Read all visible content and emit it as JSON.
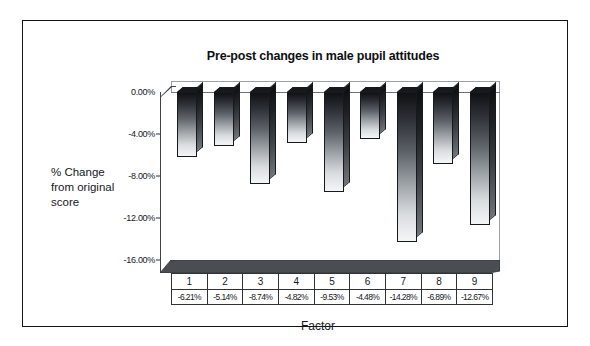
{
  "chart": {
    "title": "Pre-post changes in male pupil attitudes",
    "y_axis_title_line1": "% Change",
    "y_axis_title_line2": "from original",
    "y_axis_title_line3": "score",
    "x_axis_title": "Factor"
  },
  "chart_data": {
    "type": "bar",
    "title": "Pre-post changes in male pupil attitudes",
    "xlabel": "Factor",
    "ylabel": "% Change from original score",
    "categories": [
      "1",
      "2",
      "3",
      "4",
      "5",
      "6",
      "7",
      "8",
      "9"
    ],
    "values": [
      -6.21,
      -5.14,
      -8.74,
      -4.82,
      -9.53,
      -4.48,
      -14.28,
      -6.89,
      -12.67
    ],
    "value_labels": [
      "-6.21%",
      "-5.14%",
      "-8.74%",
      "-4.82%",
      "-9.53%",
      "-4.48%",
      "-14.28%",
      "-6.89%",
      "-12.67%"
    ],
    "ylim": [
      -16,
      0
    ],
    "ytick_labels": [
      "0.00%",
      "-4.00%",
      "-8.00%",
      "-12.00%",
      "-16.00%"
    ],
    "ytick_values": [
      0,
      -4,
      -8,
      -12,
      -16
    ],
    "grid": false,
    "legend": false,
    "data_table_visible": true,
    "style": "3d-gradient-column",
    "bar_color": "#2a2d33"
  }
}
